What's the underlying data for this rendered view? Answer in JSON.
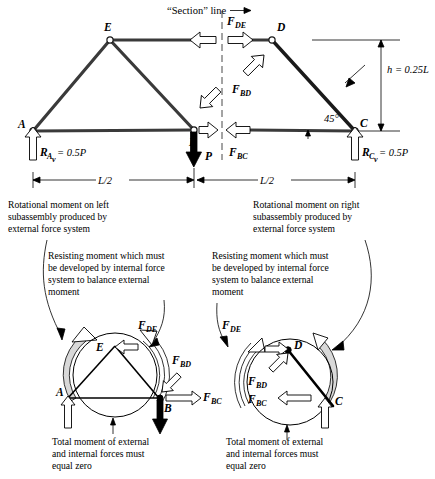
{
  "figure": {
    "title_annotation": "“Section” line",
    "top_diagram": {
      "nodes": [
        {
          "id": "A",
          "label": "A"
        },
        {
          "id": "B",
          "label": "B"
        },
        {
          "id": "C",
          "label": "C"
        },
        {
          "id": "D",
          "label": "D"
        },
        {
          "id": "E",
          "label": "E"
        }
      ],
      "forces": [
        {
          "name": "F_DE",
          "base": "F",
          "sub": "DE"
        },
        {
          "name": "F_BD",
          "base": "F",
          "sub": "BD"
        },
        {
          "name": "F_BC",
          "base": "F",
          "sub": "BC"
        }
      ],
      "reactions": [
        {
          "base": "R",
          "sub": "A",
          "subsub": "v",
          "value": "= 0.5P"
        },
        {
          "base": "R",
          "sub": "C",
          "subsub": "v",
          "value": "= 0.5P"
        }
      ],
      "applied_load": "P",
      "height_dim": "h = 0.25L",
      "angle": "45°",
      "span_left": "L/2",
      "span_right": "L/2"
    },
    "annotations": {
      "left_rotational": "Rotational moment on left\nsubassembly produced by\nexternal force system",
      "left_rotational_lines": [
        "Rotational moment on left",
        "subassembly produced by",
        "external force system"
      ],
      "right_rotational_lines": [
        "Rotational moment on right",
        "subassembly produced by",
        "external force system"
      ],
      "left_resisting_lines": [
        "Resisting moment which must",
        "be developed by internal force",
        "system to balance external",
        "moment"
      ],
      "right_resisting_lines": [
        "Resisting moment which must",
        "be developed by internal force",
        "system to balance external",
        "moment"
      ],
      "left_total_lines": [
        "Total moment of external",
        "and internal forces must",
        "equal zero"
      ],
      "right_total_lines": [
        "Total moment of external",
        "and internal forces must",
        "equal zero"
      ]
    },
    "bottom_left": {
      "nodes": [
        {
          "id": "A",
          "label": "A"
        },
        {
          "id": "B",
          "label": "B"
        },
        {
          "id": "E",
          "label": "E"
        }
      ],
      "forces": [
        {
          "base": "F",
          "sub": "DE"
        },
        {
          "base": "F",
          "sub": "BD"
        },
        {
          "base": "F",
          "sub": "BC"
        }
      ]
    },
    "bottom_right": {
      "nodes": [
        {
          "id": "C",
          "label": "C"
        },
        {
          "id": "D",
          "label": "D"
        }
      ],
      "forces": [
        {
          "base": "F",
          "sub": "DE"
        },
        {
          "base": "F",
          "sub": "BD"
        },
        {
          "base": "F",
          "sub": "BC"
        }
      ]
    }
  },
  "colors": {
    "member": "#3a3a3a",
    "member_dark": "#1a1a1a",
    "line": "#000000",
    "band": "#d8d8d8",
    "background": "#ffffff"
  }
}
